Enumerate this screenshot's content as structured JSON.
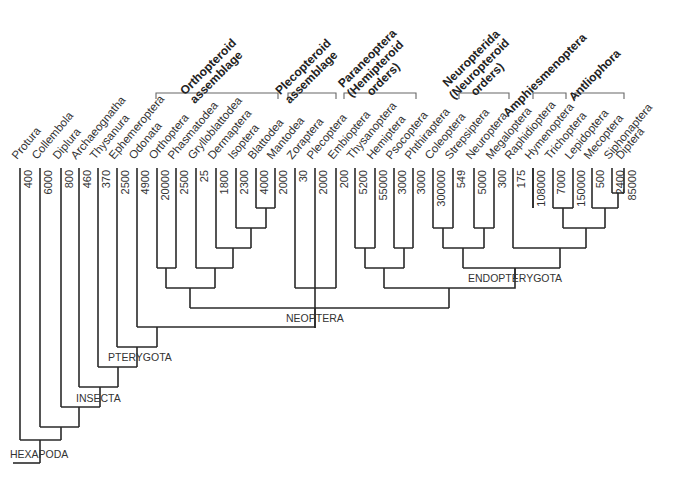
{
  "diagram": {
    "type": "phylogenetic-tree",
    "title": "",
    "taxa": [
      {
        "name": "Protura",
        "species": "400",
        "x": 20
      },
      {
        "name": "Collembola",
        "species": "6000",
        "x": 40
      },
      {
        "name": "Diplura",
        "species": "800",
        "x": 61
      },
      {
        "name": "Archaeognatha",
        "species": "460",
        "x": 79
      },
      {
        "name": "Thysanura",
        "species": "370",
        "x": 98
      },
      {
        "name": "Ephemeroptera",
        "species": "2500",
        "x": 117
      },
      {
        "name": "Odonata",
        "species": "4900",
        "x": 137
      },
      {
        "name": "Orthoptera",
        "species": "20000",
        "x": 157
      },
      {
        "name": "Phasmatodea",
        "species": "2500",
        "x": 176
      },
      {
        "name": "Grylloblattodea",
        "species": "25",
        "x": 196
      },
      {
        "name": "Dermaptera",
        "species": "1800",
        "x": 216
      },
      {
        "name": "Isoptera",
        "species": "2300",
        "x": 236
      },
      {
        "name": "Blattodea",
        "species": "4000",
        "x": 256
      },
      {
        "name": "Mantodea",
        "species": "2000",
        "x": 275
      },
      {
        "name": "Zoraptera",
        "species": "30",
        "x": 295
      },
      {
        "name": "Plecoptera",
        "species": "2000",
        "x": 315
      },
      {
        "name": "Embioptera",
        "species": "200",
        "x": 336
      },
      {
        "name": "Thysanoptera",
        "species": "5200",
        "x": 355
      },
      {
        "name": "Hemiptera",
        "species": "55000",
        "x": 375
      },
      {
        "name": "Psocoptera",
        "species": "3000",
        "x": 394
      },
      {
        "name": "Phthiraptera",
        "species": "3000",
        "x": 413
      },
      {
        "name": "Coleoptera",
        "species": "300000",
        "x": 433
      },
      {
        "name": "Strepsiptera",
        "species": "549",
        "x": 453
      },
      {
        "name": "Neuroptera",
        "species": "5000",
        "x": 474
      },
      {
        "name": "Megaloptera",
        "species": "300",
        "x": 494
      },
      {
        "name": "Raphidioptera",
        "species": "175",
        "x": 513
      },
      {
        "name": "Hymenoptera",
        "species": "108000",
        "x": 533
      },
      {
        "name": "Trichoptera",
        "species": "7000",
        "x": 553
      },
      {
        "name": "Lepidoptera",
        "species": "150000",
        "x": 573
      },
      {
        "name": "Mecoptera",
        "species": "500",
        "x": 592
      },
      {
        "name": "Siphonaptera",
        "species": "2400",
        "x": 612
      },
      {
        "name": "Diptera",
        "species": "85000",
        "x": 624
      }
    ],
    "groups": [
      {
        "label_lines": [
          "Orthopteroid",
          "assemblage"
        ],
        "x1": 156,
        "x2": 278
      },
      {
        "label_lines": [
          "Plecopteroid",
          "assemblage"
        ],
        "x1": 288,
        "x2": 336
      },
      {
        "label_lines": [
          "Paraneoptera",
          "(Hemipteroid",
          "orders)"
        ],
        "x1": 344,
        "x2": 416
      },
      {
        "label_lines": [
          "Neuropterida",
          "(Neuropteroid",
          "orders)"
        ],
        "x1": 459,
        "x2": 509
      },
      {
        "label_lines": [
          "Amphiesmenoptera"
        ],
        "x1": 533,
        "x2": 566
      },
      {
        "label_lines": [
          "Antliophora"
        ],
        "x1": 575,
        "x2": 624
      }
    ],
    "clades": {
      "hexapoda": "HEXAPODA",
      "insecta": "INSECTA",
      "pterygota": "PTERYGOTA",
      "neoptera": "NEOPTERA",
      "endopterygota": "ENDOPTERYGOTA"
    }
  }
}
